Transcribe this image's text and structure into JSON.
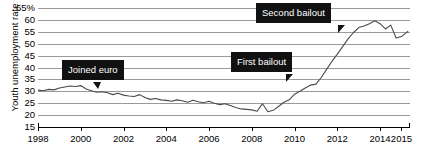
{
  "chart_data": {
    "type": "line",
    "title": "",
    "xlabel": "",
    "ylabel": "Youth unemployment rate",
    "ylim": [
      15,
      65
    ],
    "xlim": [
      1998,
      2015.4
    ],
    "yticks": [
      "15",
      "20",
      "25",
      "30",
      "35",
      "40",
      "45",
      "50",
      "55",
      "60",
      "65%"
    ],
    "ytick_values": [
      15,
      20,
      25,
      30,
      35,
      40,
      45,
      50,
      55,
      60,
      65
    ],
    "xticks": [
      "1998",
      "2000",
      "2002",
      "2004",
      "2006",
      "2008",
      "2010",
      "2012",
      "2014",
      "2015"
    ],
    "xtick_values": [
      1998,
      2000,
      2002,
      2004,
      2006,
      2008,
      2010,
      2012,
      2014,
      2015
    ],
    "grid": true,
    "legend": "none",
    "line_color": "#4a4a4a",
    "series": [
      {
        "name": "Youth unemployment rate",
        "x": [
          1998.0,
          1998.25,
          1998.5,
          1998.75,
          1999.0,
          1999.25,
          1999.5,
          1999.75,
          2000.0,
          2000.25,
          2000.5,
          2000.75,
          2001.0,
          2001.25,
          2001.5,
          2001.75,
          2002.0,
          2002.25,
          2002.5,
          2002.75,
          2003.0,
          2003.25,
          2003.5,
          2003.75,
          2004.0,
          2004.25,
          2004.5,
          2004.75,
          2005.0,
          2005.25,
          2005.5,
          2005.75,
          2006.0,
          2006.25,
          2006.5,
          2006.75,
          2007.0,
          2007.25,
          2007.5,
          2007.75,
          2008.0,
          2008.25,
          2008.5,
          2008.75,
          2009.0,
          2009.25,
          2009.5,
          2009.75,
          2010.0,
          2010.25,
          2010.5,
          2010.75,
          2011.0,
          2011.25,
          2011.5,
          2011.75,
          2012.0,
          2012.25,
          2012.5,
          2012.75,
          2013.0,
          2013.25,
          2013.5,
          2013.75,
          2014.0,
          2014.25,
          2014.5,
          2014.75,
          2015.0,
          2015.3
        ],
        "y": [
          30.5,
          30.2,
          30.8,
          30.6,
          31.4,
          31.8,
          32.2,
          32.0,
          32.4,
          31.0,
          30.2,
          29.6,
          29.8,
          29.4,
          28.6,
          29.2,
          28.4,
          28.0,
          27.8,
          28.6,
          27.4,
          26.6,
          27.0,
          26.4,
          26.2,
          25.8,
          26.4,
          26.0,
          25.4,
          26.2,
          25.6,
          25.2,
          25.8,
          25.0,
          24.4,
          24.8,
          24.0,
          23.2,
          22.6,
          22.4,
          22.2,
          21.6,
          24.8,
          21.4,
          22.0,
          23.6,
          25.4,
          26.4,
          28.8,
          30.0,
          31.4,
          32.6,
          33.0,
          35.8,
          39.2,
          42.6,
          45.6,
          48.8,
          52.0,
          54.6,
          56.8,
          57.4,
          58.4,
          59.6,
          58.4,
          56.2,
          57.8,
          52.4,
          53.0,
          55.2
        ]
      }
    ],
    "annotations": [
      {
        "name": "joined-euro",
        "label": "Joined euro",
        "pointer": "bottom"
      },
      {
        "name": "first-bailout",
        "label": "First bailout",
        "pointer": "bottom-right"
      },
      {
        "name": "second-bailout",
        "label": "Second bailout",
        "pointer": "bottom-right"
      }
    ]
  },
  "axis": {
    "y_title": "Youth unemployment rate"
  }
}
